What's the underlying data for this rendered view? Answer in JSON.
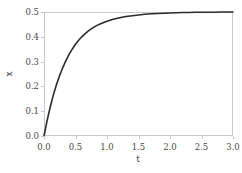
{
  "chart_data": {
    "type": "line",
    "title": "",
    "subtitle": "",
    "xlabel": "t",
    "ylabel": "x",
    "xlim": [
      0.0,
      3.0
    ],
    "ylim": [
      0.0,
      0.5
    ],
    "grid": false,
    "legend": null,
    "xticks": [
      "0.0",
      "0.5",
      "1.0",
      "1.5",
      "2.0",
      "2.5",
      "3.0"
    ],
    "xtick_values": [
      0.0,
      0.5,
      1.0,
      1.5,
      2.0,
      2.5,
      3.0
    ],
    "yticks": [
      "0.0",
      "0.1",
      "0.2",
      "0.3",
      "0.4",
      "0.5"
    ],
    "ytick_values": [
      0.0,
      0.1,
      0.2,
      0.3,
      0.4,
      0.5
    ],
    "line_color": "#2b2b2b",
    "line_width": 1.6,
    "frame_color": "#c9c9c9",
    "background_color": "#ffffff",
    "series": [
      {
        "name": "x(t)",
        "x": [
          0.0,
          0.05,
          0.1,
          0.15,
          0.2,
          0.25,
          0.3,
          0.35,
          0.4,
          0.45,
          0.5,
          0.55,
          0.6,
          0.65,
          0.7,
          0.75,
          0.8,
          0.85,
          0.9,
          0.95,
          1.0,
          1.1,
          1.2,
          1.3,
          1.4,
          1.5,
          1.6,
          1.7,
          1.8,
          1.9,
          2.0,
          2.1,
          2.2,
          2.3,
          2.4,
          2.5,
          2.6,
          2.7,
          2.8,
          2.9,
          3.0
        ],
        "y": [
          0.0,
          0.063,
          0.118,
          0.167,
          0.209,
          0.245,
          0.277,
          0.305,
          0.33,
          0.351,
          0.37,
          0.386,
          0.4,
          0.412,
          0.423,
          0.432,
          0.44,
          0.447,
          0.453,
          0.458,
          0.463,
          0.471,
          0.477,
          0.482,
          0.485,
          0.488,
          0.491,
          0.493,
          0.494,
          0.495,
          0.496,
          0.497,
          0.498,
          0.498,
          0.499,
          0.499,
          0.499,
          0.499,
          0.5,
          0.5,
          0.5
        ]
      }
    ]
  }
}
